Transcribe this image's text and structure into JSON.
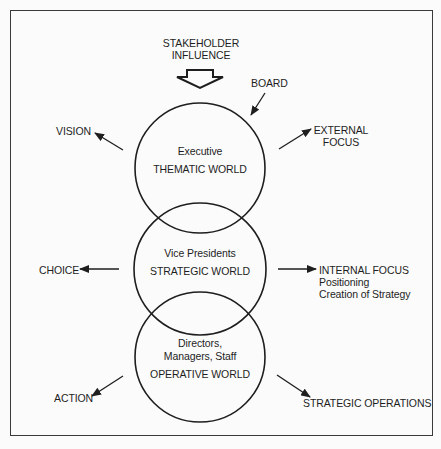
{
  "diagram": {
    "top_input": {
      "line1": "STAKEHOLDER",
      "line2": "INFLUENCE"
    },
    "board_label": "BOARD",
    "circles": [
      {
        "id": "thematic",
        "role": "Executive",
        "world": "THEMATIC WORLD"
      },
      {
        "id": "strategic",
        "role": "Vice Presidents",
        "world": "STRATEGIC WORLD"
      },
      {
        "id": "operative",
        "role_line1": "Directors,",
        "role_line2": "Managers, Staff",
        "world": "OPERATIVE WORLD"
      }
    ],
    "outputs": {
      "vision": "VISION",
      "external_focus": {
        "line1": "EXTERNAL",
        "line2": "FOCUS"
      },
      "choice": "CHOICE",
      "internal_focus": {
        "line1": "INTERNAL FOCUS",
        "line2": "Positioning",
        "line3": "Creation of Strategy"
      },
      "action": "ACTION",
      "strategic_operations": "STRATEGIC OPERATIONS"
    },
    "colors": {
      "stroke": "#1e1e1e",
      "background": "#fbfbfb",
      "frame": "#3a3a3a"
    }
  }
}
